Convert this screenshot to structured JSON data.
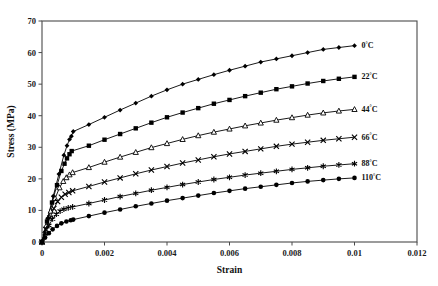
{
  "chart_data": {
    "type": "line",
    "title": "",
    "xlabel": "Strain",
    "ylabel": "Stress (MPa)",
    "xlim": [
      0,
      0.012
    ],
    "ylim": [
      0,
      70
    ],
    "xticks": [
      "0",
      "0.002",
      "0.004",
      "0.006",
      "0.008",
      "0.01",
      "0.012"
    ],
    "xtick_values": [
      0,
      0.002,
      0.004,
      0.006,
      0.008,
      0.01,
      0.012
    ],
    "yticks": [
      "0",
      "10",
      "20",
      "30",
      "40",
      "50",
      "60",
      "70"
    ],
    "ytick_values": [
      0,
      10,
      20,
      30,
      40,
      50,
      60,
      70
    ],
    "grid": false,
    "legend_position": "right-inline-end-of-line",
    "series": [
      {
        "name": "0°C",
        "label_main": "0",
        "label_sup": "°",
        "label_tail": "C",
        "marker": "diamond",
        "color": "#000000",
        "x": [
          0,
          0.00018,
          0.00036,
          0.00054,
          0.0007,
          0.0008,
          0.00088,
          0.00094,
          0.001,
          0.0015,
          0.002,
          0.0025,
          0.003,
          0.0035,
          0.004,
          0.0045,
          0.005,
          0.0055,
          0.006,
          0.0065,
          0.007,
          0.0075,
          0.008,
          0.0085,
          0.009,
          0.0095,
          0.01
        ],
        "y": [
          0,
          7.5,
          14.5,
          21.5,
          27.5,
          30.5,
          32.5,
          33.5,
          35.0,
          37.2,
          39.5,
          41.8,
          44.0,
          46.2,
          48.2,
          50.0,
          51.5,
          53.0,
          54.4,
          55.7,
          57.0,
          58.0,
          59.0,
          60.0,
          61.0,
          61.6,
          62.2
        ]
      },
      {
        "name": "22°C",
        "label_main": "22",
        "label_sup": "°",
        "label_tail": "C",
        "marker": "square",
        "color": "#000000",
        "x": [
          0,
          0.00016,
          0.00032,
          0.00048,
          0.00062,
          0.00072,
          0.0008,
          0.00088,
          0.00095,
          0.0015,
          0.002,
          0.0025,
          0.003,
          0.0035,
          0.004,
          0.0045,
          0.005,
          0.0055,
          0.006,
          0.0065,
          0.007,
          0.0075,
          0.008,
          0.0085,
          0.009,
          0.0095,
          0.01
        ],
        "y": [
          0,
          6.5,
          12.5,
          18.0,
          22.5,
          24.8,
          26.5,
          27.8,
          28.8,
          30.5,
          32.4,
          34.2,
          36.0,
          37.8,
          39.5,
          41.0,
          42.4,
          43.8,
          45.0,
          46.2,
          47.3,
          48.4,
          49.3,
          50.2,
          51.0,
          51.7,
          52.3
        ]
      },
      {
        "name": "44°C",
        "label_main": "44",
        "label_sup": "°",
        "label_tail": "C",
        "marker": "triangle-open",
        "color": "#000000",
        "x": [
          0,
          0.00014,
          0.00028,
          0.00042,
          0.00056,
          0.00068,
          0.00078,
          0.00088,
          0.00098,
          0.0015,
          0.002,
          0.0025,
          0.003,
          0.0035,
          0.004,
          0.0045,
          0.005,
          0.0055,
          0.006,
          0.0065,
          0.007,
          0.0075,
          0.008,
          0.0085,
          0.009,
          0.0095,
          0.01
        ],
        "y": [
          0,
          5.2,
          9.8,
          13.8,
          17.2,
          19.2,
          20.4,
          21.3,
          22.0,
          23.6,
          25.3,
          26.9,
          28.4,
          29.9,
          31.2,
          32.5,
          33.7,
          34.8,
          35.8,
          36.8,
          37.7,
          38.6,
          39.4,
          40.2,
          40.9,
          41.5,
          42.0
        ]
      },
      {
        "name": "66°C",
        "label_main": "66",
        "label_sup": "°",
        "label_tail": "C",
        "marker": "x",
        "color": "#000000",
        "x": [
          0,
          0.00012,
          0.00025,
          0.00038,
          0.0005,
          0.00062,
          0.00074,
          0.00086,
          0.00098,
          0.0015,
          0.002,
          0.0025,
          0.003,
          0.0035,
          0.004,
          0.0045,
          0.005,
          0.0055,
          0.006,
          0.0065,
          0.007,
          0.0075,
          0.008,
          0.0085,
          0.009,
          0.0095,
          0.01
        ],
        "y": [
          0,
          4.0,
          7.6,
          10.6,
          12.8,
          14.2,
          15.1,
          15.7,
          16.2,
          17.6,
          19.0,
          20.3,
          21.6,
          22.8,
          23.9,
          25.0,
          26.0,
          27.0,
          27.9,
          28.7,
          29.5,
          30.3,
          31.0,
          31.6,
          32.2,
          32.7,
          33.2
        ]
      },
      {
        "name": "88°C",
        "label_main": "88",
        "label_sup": "°",
        "label_tail": "C",
        "marker": "star",
        "color": "#000000",
        "x": [
          0,
          0.0001,
          0.00022,
          0.00034,
          0.00046,
          0.00058,
          0.0007,
          0.00084,
          0.00098,
          0.0015,
          0.002,
          0.0025,
          0.003,
          0.0035,
          0.004,
          0.0045,
          0.005,
          0.0055,
          0.006,
          0.0065,
          0.007,
          0.0075,
          0.008,
          0.0085,
          0.009,
          0.0095,
          0.01
        ],
        "y": [
          0,
          2.6,
          5.2,
          7.3,
          8.8,
          9.8,
          10.4,
          10.8,
          11.1,
          12.2,
          13.3,
          14.4,
          15.4,
          16.4,
          17.3,
          18.2,
          19.0,
          19.8,
          20.5,
          21.2,
          21.8,
          22.4,
          23.0,
          23.5,
          24.0,
          24.4,
          24.8
        ]
      },
      {
        "name": "110°C",
        "label_main": "110",
        "label_sup": "°",
        "label_tail": "C",
        "marker": "circle",
        "color": "#000000",
        "x": [
          0,
          0.0001,
          0.00022,
          0.00034,
          0.00048,
          0.00062,
          0.00078,
          0.00092,
          0.001,
          0.0015,
          0.002,
          0.0025,
          0.003,
          0.0035,
          0.004,
          0.0045,
          0.005,
          0.0055,
          0.006,
          0.0065,
          0.007,
          0.0075,
          0.008,
          0.0085,
          0.009,
          0.0095,
          0.01
        ],
        "y": [
          0,
          1.4,
          2.8,
          4.0,
          5.1,
          5.9,
          6.5,
          6.9,
          7.1,
          8.2,
          9.3,
          10.3,
          11.3,
          12.2,
          13.1,
          13.9,
          14.7,
          15.5,
          16.2,
          16.9,
          17.5,
          18.1,
          18.7,
          19.2,
          19.6,
          20.0,
          20.3
        ]
      }
    ]
  }
}
